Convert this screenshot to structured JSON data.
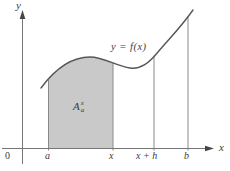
{
  "figure": {
    "title_semantic": "area-under-curve-diagram",
    "colors": {
      "background": "#ffffff",
      "region_fill": "#c9c9c9",
      "curve_stroke": "#565656",
      "axis_stroke": "#767676",
      "text": "#3b3b3b"
    },
    "labels": {
      "y_axis": "y",
      "x_axis": "x",
      "origin": "0",
      "tick_a": "a",
      "tick_x": "x",
      "tick_x_plus_h": "x + h",
      "tick_b": "b",
      "curve_equation": "y = f(x)",
      "area_base": "A",
      "area_superscript": "x",
      "area_subscript": "a"
    }
  }
}
